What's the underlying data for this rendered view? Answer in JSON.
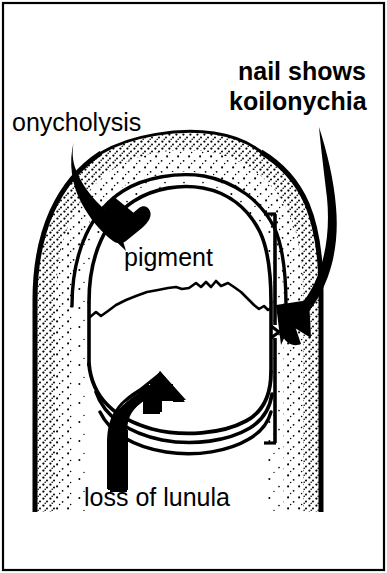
{
  "figure": {
    "kind": "medical-line-illustration",
    "caption_present": false,
    "colors": {
      "ink": "#000000",
      "paper": "#ffffff",
      "stipple": "#000000"
    },
    "frame": {
      "present": true,
      "stroke": "#000000",
      "stroke_width": 2
    }
  },
  "labels": {
    "onycholysis": {
      "text": "onycholysis",
      "font_size": 25,
      "weight": "regular",
      "x": 12,
      "y": 131
    },
    "koilonychia": {
      "line1": "nail shows",
      "line2": "koilonychia",
      "font_size": 25,
      "weight": "bold",
      "x": 218,
      "y1": 80,
      "y2": 110
    },
    "pigment": {
      "text": "pigment",
      "font_size": 25,
      "weight": "regular",
      "x": 123,
      "y": 265
    },
    "lunula": {
      "text": "loss of lunula",
      "font_size": 25,
      "weight": "regular",
      "x": 84,
      "y": 505
    }
  },
  "annotations": [
    {
      "name": "onycholysis-arrow",
      "points_to": "proximal nail fold / detached nail edge",
      "direction": "down-right",
      "tail": [
        78,
        142
      ],
      "tip": [
        124,
        216
      ]
    },
    {
      "name": "koilonychia-arrow",
      "points_to": "lateral nail plate concavity",
      "direction": "down-left",
      "tail": [
        320,
        128
      ],
      "tip": [
        289,
        334
      ]
    },
    {
      "name": "lunula-arrow",
      "points_to": "distal nail / absent lunula region",
      "direction": "up",
      "tail": [
        121,
        487
      ],
      "tip": [
        150,
        398
      ]
    },
    {
      "name": "koilonychia-bracket",
      "kind": "vertical-caliper",
      "x": 272,
      "y_top": 213,
      "y_bottom": 443
    }
  ],
  "anatomy": {
    "finger_outline": "stippled digit silhouette, rounded distal tip",
    "nail_plate": "large oval plate occupying the digit tip",
    "pigment_band": "irregular wavy transverse boundary across nail mid-plate",
    "distal_arcs": 3,
    "lunula": "absent"
  }
}
